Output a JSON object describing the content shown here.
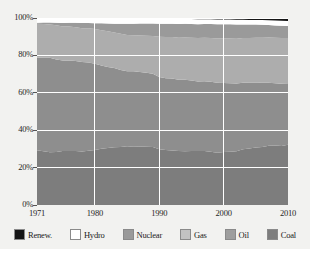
{
  "chart_data": {
    "type": "area",
    "stacked": true,
    "normalized_percent": true,
    "title": "",
    "subtitle": "",
    "xlabel": "",
    "ylabel": "",
    "xlim": [
      1971,
      2010
    ],
    "ylim": [
      0,
      100
    ],
    "grid": true,
    "legend_position": "bottom",
    "x_tick_labels": [
      "1971",
      "1980",
      "1990",
      "2000",
      "2010"
    ],
    "x_tick_values": [
      1971,
      1980,
      1990,
      2000,
      2010
    ],
    "y_tick_labels": [
      "0%",
      "20%",
      "40%",
      "60%",
      "80%",
      "100%"
    ],
    "y_tick_values": [
      0,
      20,
      40,
      60,
      80,
      100
    ],
    "x": [
      1971,
      1972,
      1973,
      1974,
      1975,
      1976,
      1977,
      1978,
      1979,
      1980,
      1981,
      1982,
      1983,
      1984,
      1985,
      1986,
      1987,
      1988,
      1989,
      1990,
      1991,
      1992,
      1993,
      1994,
      1995,
      1996,
      1997,
      1998,
      1999,
      2000,
      2001,
      2002,
      2003,
      2004,
      2005,
      2006,
      2007,
      2008,
      2009,
      2010
    ],
    "stack_order_bottom_to_top": [
      "Coal",
      "Oil",
      "Gas",
      "Nuclear",
      "Hydro",
      "Renew."
    ],
    "series": [
      {
        "name": "Coal",
        "color": "#7d7d7d",
        "values": [
          26.0,
          25.6,
          25.3,
          25.2,
          25.6,
          25.8,
          26.0,
          25.8,
          26.4,
          26.2,
          26.3,
          26.6,
          26.9,
          27.2,
          27.8,
          27.6,
          27.8,
          27.8,
          27.6,
          26.2,
          25.8,
          25.4,
          25.2,
          25.0,
          25.2,
          25.3,
          25.2,
          24.9,
          24.6,
          24.8,
          24.9,
          25.2,
          26.2,
          26.7,
          27.2,
          27.5,
          28.0,
          27.9,
          27.5,
          28.2
        ]
      },
      {
        "name": "Oil",
        "color": "#8e8e8e",
        "values": [
          44.0,
          44.6,
          45.2,
          44.0,
          42.9,
          43.4,
          43.2,
          43.0,
          43.0,
          41.0,
          39.0,
          37.7,
          36.9,
          36.2,
          35.4,
          35.9,
          35.5,
          35.4,
          34.9,
          34.0,
          33.6,
          33.6,
          33.3,
          33.2,
          32.8,
          32.5,
          32.6,
          32.8,
          32.9,
          32.2,
          31.9,
          31.6,
          31.3,
          31.2,
          30.8,
          30.3,
          29.9,
          29.3,
          29.0,
          28.4
        ]
      },
      {
        "name": "Gas",
        "color": "#adadad",
        "values": [
          16.0,
          16.1,
          16.0,
          16.2,
          16.1,
          16.2,
          16.2,
          16.3,
          16.6,
          16.6,
          16.6,
          16.7,
          16.5,
          17.0,
          17.2,
          17.0,
          17.4,
          17.6,
          18.0,
          19.0,
          19.3,
          19.4,
          19.6,
          19.6,
          20.0,
          20.4,
          20.3,
          20.5,
          20.8,
          20.8,
          20.9,
          21.0,
          21.0,
          21.0,
          21.2,
          21.3,
          21.4,
          21.3,
          21.3,
          21.4
        ]
      },
      {
        "name": "Nuclear",
        "color": "#9a9a9a",
        "values": [
          0.5,
          0.7,
          0.9,
          1.2,
          1.6,
          1.8,
          2.2,
          2.5,
          2.6,
          2.7,
          3.2,
          3.6,
          4.1,
          4.7,
          5.3,
          5.5,
          5.7,
          5.9,
          6.0,
          6.1,
          6.2,
          6.2,
          6.4,
          6.4,
          6.4,
          6.5,
          6.4,
          6.5,
          6.7,
          6.7,
          6.7,
          6.7,
          6.4,
          6.3,
          6.3,
          6.2,
          5.9,
          5.8,
          5.7,
          5.7
        ]
      },
      {
        "name": "Hydro",
        "color": "#ffffff",
        "values": [
          1.9,
          1.9,
          1.9,
          2.0,
          2.1,
          2.0,
          2.0,
          2.1,
          2.1,
          2.1,
          2.1,
          2.2,
          2.3,
          2.3,
          2.3,
          2.3,
          2.2,
          2.2,
          2.2,
          2.2,
          2.2,
          2.2,
          2.3,
          2.2,
          2.3,
          2.3,
          2.2,
          2.2,
          2.2,
          2.2,
          2.2,
          2.2,
          2.2,
          2.2,
          2.2,
          2.2,
          2.2,
          2.3,
          2.3,
          2.3
        ]
      },
      {
        "name": "Renew.",
        "color": "#151515",
        "values": [
          0.3,
          0.3,
          0.3,
          0.3,
          0.3,
          0.3,
          0.3,
          0.3,
          0.3,
          0.4,
          0.4,
          0.4,
          0.4,
          0.4,
          0.4,
          0.4,
          0.4,
          0.4,
          0.4,
          0.5,
          0.5,
          0.5,
          0.5,
          0.5,
          0.5,
          0.6,
          0.6,
          0.6,
          0.7,
          0.7,
          0.7,
          0.8,
          0.8,
          0.9,
          0.9,
          1.0,
          1.1,
          1.2,
          1.3,
          1.4
        ]
      }
    ],
    "legend": [
      {
        "label": "Renew.",
        "color": "#151515"
      },
      {
        "label": "Hydro",
        "color": "#ffffff"
      },
      {
        "label": "Nuclear",
        "color": "#9a9a9a"
      },
      {
        "label": "Gas",
        "color": "#c2c2c2"
      },
      {
        "label": "Oil",
        "color": "#9e9e9e"
      },
      {
        "label": "Coal",
        "color": "#7d7d7d"
      }
    ]
  },
  "style": {
    "figure_background": "#f2f2f0",
    "plot_background": "#ffffff",
    "grid_color": "#ffffff",
    "tick_color": "#555555",
    "text_color": "#1f1f1f"
  }
}
